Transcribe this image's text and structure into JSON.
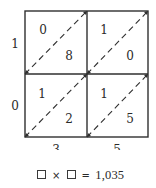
{
  "diagram": {
    "type": "lattice-multiplication",
    "left_digits": [
      "1",
      "0"
    ],
    "bottom_digits": [
      "3",
      "5"
    ],
    "cells": [
      {
        "row": 0,
        "col": 0,
        "upper": "0",
        "lower": "8"
      },
      {
        "row": 0,
        "col": 1,
        "upper": "1",
        "lower": "0"
      },
      {
        "row": 1,
        "col": 0,
        "upper": "1",
        "lower": "2"
      },
      {
        "row": 1,
        "col": 1,
        "upper": "1",
        "lower": "5"
      }
    ],
    "colors": {
      "line": "#2f2f2f",
      "text": "#2a2a2a",
      "background": "#ffffff"
    }
  },
  "equation": {
    "operand1_placeholder": "□",
    "operator": "×",
    "operand2_placeholder": "□",
    "equals": "=",
    "result": "1,035"
  }
}
